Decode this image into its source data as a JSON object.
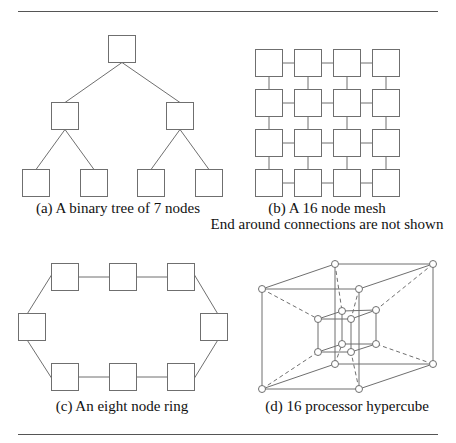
{
  "colors": {
    "line": "#6f6f6f",
    "rule": "#555555",
    "text": "#111111",
    "node_fill": "#ffffff"
  },
  "rules": [
    {
      "x1": 18,
      "x2": 438,
      "y": 11
    },
    {
      "x1": 18,
      "x2": 438,
      "y": 434
    }
  ],
  "figures": {
    "a": {
      "caption": "(a) A binary tree of 7 nodes",
      "caption_pos": [
        118,
        200
      ],
      "box_size": 27,
      "nodes": [
        {
          "id": "root",
          "x": 108,
          "y": 35
        },
        {
          "id": "l",
          "x": 51,
          "y": 102
        },
        {
          "id": "r",
          "x": 166,
          "y": 102
        },
        {
          "id": "ll",
          "x": 22,
          "y": 169
        },
        {
          "id": "lr",
          "x": 80,
          "y": 169
        },
        {
          "id": "rl",
          "x": 137,
          "y": 169
        },
        {
          "id": "rr",
          "x": 195,
          "y": 169
        }
      ],
      "edges": [
        [
          "root",
          "l"
        ],
        [
          "root",
          "r"
        ],
        [
          "l",
          "ll"
        ],
        [
          "l",
          "lr"
        ],
        [
          "r",
          "rl"
        ],
        [
          "r",
          "rr"
        ]
      ]
    },
    "b": {
      "caption": "(b) A 16 node mesh",
      "caption2": "End around connections are not shown",
      "caption_pos": [
        327,
        200
      ],
      "caption2_pos": [
        327,
        216
      ],
      "box_size": 27,
      "cols_x": [
        255,
        294,
        333,
        372
      ],
      "rows_y": [
        49,
        89,
        129,
        169
      ]
    },
    "c": {
      "caption": "(c) An eight node ring",
      "caption_pos": [
        122,
        398
      ],
      "box_size": 27,
      "nodes": [
        {
          "id": "t1",
          "x": 51,
          "y": 263
        },
        {
          "id": "t2",
          "x": 109,
          "y": 263
        },
        {
          "id": "t3",
          "x": 167,
          "y": 263
        },
        {
          "id": "rs",
          "x": 200,
          "y": 313
        },
        {
          "id": "b3",
          "x": 167,
          "y": 363
        },
        {
          "id": "b2",
          "x": 109,
          "y": 363
        },
        {
          "id": "b1",
          "x": 51,
          "y": 363
        },
        {
          "id": "ls",
          "x": 18,
          "y": 313
        }
      ]
    },
    "d": {
      "caption": "(d) 16 processor hypercube",
      "caption_pos": [
        347,
        398
      ],
      "node_radius": 3.5,
      "outer": {
        "ftl": [
          262,
          289
        ],
        "ftr": [
          359,
          289
        ],
        "fbl": [
          262,
          389
        ],
        "fbr": [
          359,
          389
        ],
        "btl": [
          335,
          264
        ],
        "btr": [
          433,
          264
        ],
        "bbl": [
          335,
          364
        ],
        "bbr": [
          433,
          364
        ]
      },
      "inner": {
        "ftl": [
          318,
          319
        ],
        "ftr": [
          351,
          319
        ],
        "fbl": [
          318,
          352
        ],
        "fbr": [
          351,
          352
        ],
        "btl": [
          342,
          311
        ],
        "btr": [
          376,
          310
        ],
        "bbl": [
          342,
          344
        ],
        "bbr": [
          376,
          344
        ]
      }
    }
  }
}
